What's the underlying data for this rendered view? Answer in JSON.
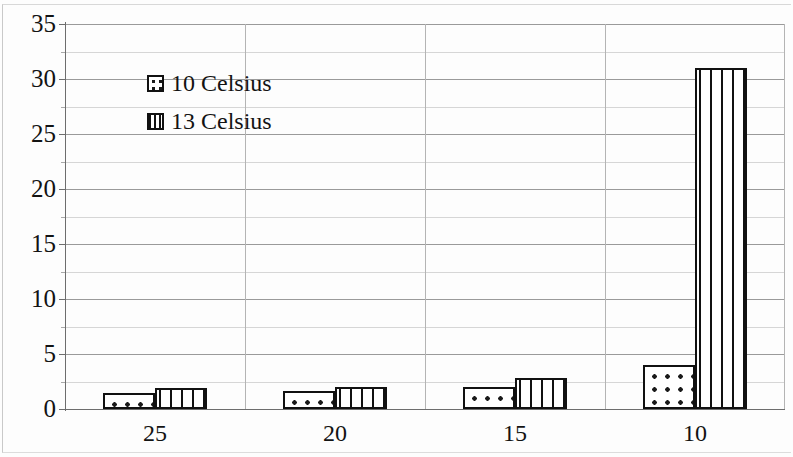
{
  "chart_data": {
    "type": "bar",
    "title": "",
    "subtitle": "",
    "xlabel": "",
    "ylabel": "",
    "categories": [
      "25",
      "20",
      "15",
      "10"
    ],
    "series": [
      {
        "name": "10 Celsius",
        "pattern": "dotted",
        "values": [
          1.5,
          1.6,
          2.0,
          4.0
        ]
      },
      {
        "name": "13 Celsius",
        "pattern": "vertical-lines",
        "values": [
          1.9,
          2.0,
          2.8,
          31.0
        ]
      }
    ],
    "ylim": [
      0,
      35
    ],
    "yticks": [
      35,
      30,
      25,
      20,
      15,
      10,
      5,
      0
    ],
    "yticks_minor": [
      32.5,
      27.5,
      22.5,
      17.5,
      12.5,
      7.5,
      2.5
    ],
    "grid": true,
    "grid_axis": "y",
    "legend_position": "top-left",
    "bar_colors": {
      "fill": "#ffffff",
      "outline": "#111111"
    }
  },
  "legend": {
    "entries": [
      {
        "label": "10 Celsius",
        "swatch": "dotted-pattern-swatch"
      },
      {
        "label": "13 Celsius",
        "swatch": "vertical-lines-pattern-swatch"
      }
    ]
  },
  "axes": {
    "y_labels": [
      "35",
      "30",
      "25",
      "20",
      "15",
      "10",
      "5",
      "0"
    ],
    "x_labels": [
      "25",
      "20",
      "15",
      "10"
    ]
  }
}
